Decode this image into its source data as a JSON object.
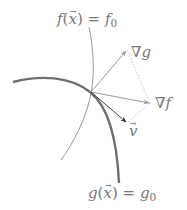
{
  "diagram": {
    "type": "lagrange-multiplier-level-curves",
    "colors": {
      "thin_curve": "#9a9a9a",
      "thick_curve": "#6f6f6f",
      "grad_g_arrow": "#9a9a9a",
      "grad_f_arrow": "#9a9a9a",
      "v_arrow": "#3a3a3a",
      "dotted": "#c8c8c8",
      "label": "#777777"
    },
    "curves": [
      {
        "name": "f-level-curve",
        "style": "thin",
        "label_func": "f",
        "label_var": "x",
        "label_rhs_base": "f",
        "label_rhs_sub": "0"
      },
      {
        "name": "g-level-curve",
        "style": "thick",
        "label_func": "g",
        "label_var": "x",
        "label_rhs_base": "g",
        "label_rhs_sub": "0"
      }
    ],
    "vectors": [
      {
        "name": "grad-g",
        "nabla": "∇",
        "symbol": "g"
      },
      {
        "name": "grad-f",
        "nabla": "∇",
        "symbol": "f"
      },
      {
        "name": "v",
        "symbol": "v"
      }
    ],
    "labels": {
      "f_curve": {
        "func": "f",
        "open": "(",
        "var": "x",
        "close": ")",
        "eq": "=",
        "rhs": "f",
        "rhs_sub": "0"
      },
      "g_curve": {
        "func": "g",
        "open": "(",
        "var": "x",
        "close": ")",
        "eq": "=",
        "rhs": "g",
        "rhs_sub": "0"
      },
      "grad_g": {
        "nabla": "∇",
        "sym": "g"
      },
      "grad_f": {
        "nabla": "∇",
        "sym": "f"
      },
      "v": {
        "sym": "v"
      }
    }
  }
}
